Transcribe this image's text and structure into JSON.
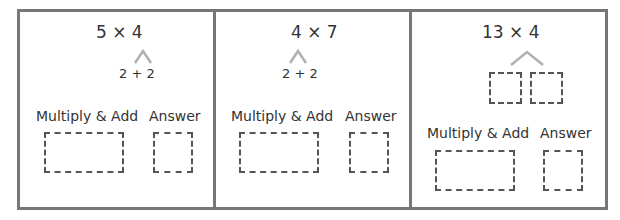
{
  "worksheet": {
    "panels": [
      {
        "expression": "5 × 4",
        "split": "2 + 2",
        "multiply_add_label": "Multiply & Add",
        "answer_label": "Answer"
      },
      {
        "expression": "4 × 7",
        "split": "2 + 2",
        "multiply_add_label": "Multiply & Add",
        "answer_label": "Answer"
      },
      {
        "expression": "13 × 4",
        "split": "",
        "multiply_add_label": "Multiply & Add",
        "answer_label": "Answer"
      }
    ],
    "colors": {
      "frame": "#777777",
      "dashed_box": "#555555",
      "caret": "#b0b0b0",
      "text": "#333333"
    }
  }
}
